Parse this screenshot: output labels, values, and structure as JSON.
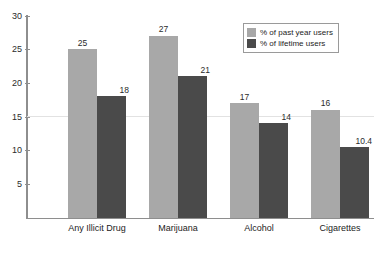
{
  "chart_data": {
    "type": "bar",
    "title": "",
    "subtitle": "",
    "xlabel": "",
    "ylabel": "",
    "categories": [
      "Any Illicit Drug",
      "Marijuana",
      "Alcohol",
      "Cigarettes"
    ],
    "series": [
      {
        "name": "% of past year users",
        "color": "#a8a8a8",
        "values": [
          25,
          27,
          17,
          16
        ],
        "labels": [
          "25",
          "27",
          "17",
          "16"
        ]
      },
      {
        "name": "% of lifetime users",
        "color": "#4a4a4a",
        "values": [
          18,
          21,
          14,
          10.4
        ],
        "labels": [
          "18",
          "21",
          "14",
          "10.4"
        ]
      }
    ],
    "ylim": [
      0,
      30
    ],
    "ytick_values": [
      5,
      10,
      15,
      20,
      25,
      30
    ],
    "ytick_labels": [
      "5",
      "10",
      "15",
      "20",
      "25",
      "30"
    ],
    "grid": true,
    "gridline_values": [
      15
    ],
    "legend_position": "top-right",
    "axis_color": "#8e8e8e"
  },
  "caption": {
    "text": ""
  }
}
